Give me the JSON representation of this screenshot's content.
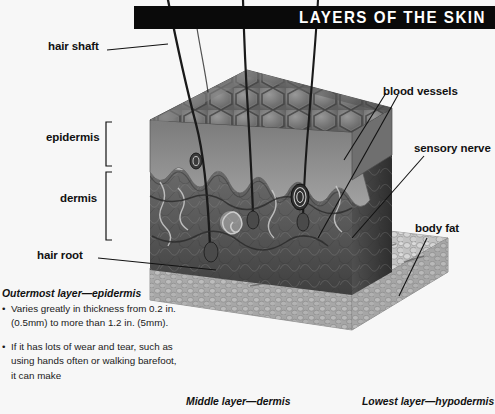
{
  "banner": {
    "title": "LAYERS OF THE SKIN",
    "bg_color": "#0a0a0a",
    "text_color": "#ffffff"
  },
  "page": {
    "background_color": "#f7f7f7",
    "illustration": "cutaway-block-diagram-of-human-skin-grayscale"
  },
  "labels": {
    "left": [
      {
        "text": "hair shaft"
      },
      {
        "text": "epidermis"
      },
      {
        "text": "dermis"
      },
      {
        "text": "hair root"
      }
    ],
    "right": [
      {
        "text": "blood vessels"
      },
      {
        "text": "sensory nerve"
      },
      {
        "text": "body fat"
      }
    ]
  },
  "notes": {
    "epidermis": {
      "heading": "Outermost layer—epidermis",
      "bullets": [
        "Varies greatly in thickness from 0.2 in. (0.5mm) to more than 1.2 in. (5mm).",
        "If it has lots of wear and tear, such as using hands often or walking barefoot, it can make"
      ]
    },
    "dermis": {
      "heading": "Middle layer—dermis"
    },
    "hypodermis": {
      "heading": "Lowest layer—hypodermis"
    }
  }
}
